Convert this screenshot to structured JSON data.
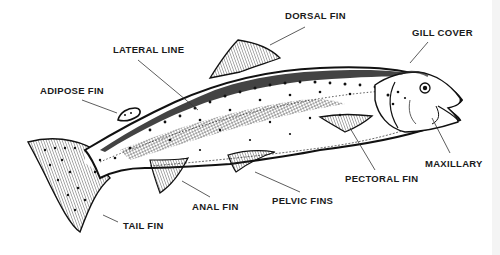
{
  "diagram": {
    "colors": {
      "ink": "#1a1a1a",
      "background": "#ffffff"
    },
    "labels": [
      {
        "id": "dorsal-fin",
        "text": "DORSAL FIN",
        "x": 285,
        "y": 10
      },
      {
        "id": "gill-cover",
        "text": "GILL COVER",
        "x": 412,
        "y": 27
      },
      {
        "id": "lateral-line",
        "text": "LATERAL LINE",
        "x": 113,
        "y": 44
      },
      {
        "id": "adipose-fin",
        "text": "ADIPOSE FIN",
        "x": 40,
        "y": 85
      },
      {
        "id": "maxillary",
        "text": "MAXILLARY",
        "x": 425,
        "y": 158
      },
      {
        "id": "pectoral-fin",
        "text": "PECTORAL FIN",
        "x": 345,
        "y": 173
      },
      {
        "id": "pelvic-fins",
        "text": "PELVIC FINS",
        "x": 272,
        "y": 195
      },
      {
        "id": "anal-fin",
        "text": "ANAL FIN",
        "x": 192,
        "y": 201
      },
      {
        "id": "tail-fin",
        "text": "TAIL FIN",
        "x": 123,
        "y": 220
      }
    ]
  }
}
